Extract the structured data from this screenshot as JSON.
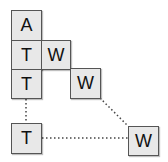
{
  "diagram": {
    "cells": [
      {
        "id": "a",
        "label": "A"
      },
      {
        "id": "t1",
        "label": "T"
      },
      {
        "id": "w1",
        "label": "W"
      },
      {
        "id": "t2",
        "label": "T"
      },
      {
        "id": "w2",
        "label": "W"
      },
      {
        "id": "t3",
        "label": "T"
      },
      {
        "id": "w3",
        "label": "W"
      }
    ],
    "edges": [
      {
        "from": "T (row 3)",
        "to": "T (bottom)",
        "style": "dotted"
      },
      {
        "from": "W (row 3)",
        "to": "W (bottom)",
        "style": "dotted"
      },
      {
        "from": "T (bottom)",
        "to": "W (bottom)",
        "style": "dotted"
      }
    ],
    "colors": {
      "cell_fill": "#e8e8e8",
      "cell_border": "#555555",
      "edge": "#444444"
    }
  }
}
